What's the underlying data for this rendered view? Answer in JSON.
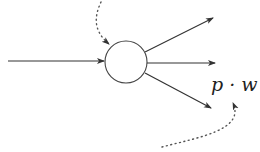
{
  "diagram": {
    "type": "neuron-fanout",
    "node": {
      "shape": "circle",
      "cx": 126,
      "cy": 62,
      "r": 21
    },
    "input_arrow": {
      "from": [
        8,
        61
      ],
      "to": [
        104,
        61
      ]
    },
    "output_arrows": [
      {
        "from": [
          145,
          52
        ],
        "to": [
          213,
          18
        ]
      },
      {
        "from": [
          147,
          63
        ],
        "to": [
          215,
          63
        ]
      },
      {
        "from": [
          145,
          73
        ],
        "to": [
          211,
          108
        ]
      }
    ],
    "label": {
      "text": "p · w"
    },
    "dotted_pointers": [
      {
        "name": "top-pointer"
      },
      {
        "name": "bottom-pointer"
      }
    ],
    "colors": {
      "stroke": "#333333",
      "dots": "#555555",
      "background": "#ffffff"
    }
  }
}
